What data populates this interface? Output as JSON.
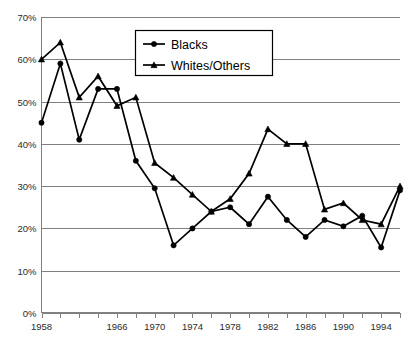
{
  "chart_data": {
    "type": "line",
    "title": "",
    "subtitle": "",
    "xlabel": "",
    "ylabel": "",
    "xlim": [
      1958,
      1996
    ],
    "ylim": [
      0,
      70
    ],
    "y_unit": "%",
    "grid": true,
    "legend_position": "top-center",
    "y_ticks": [
      "0%",
      "10%",
      "20%",
      "30%",
      "40%",
      "50%",
      "60%",
      "70%"
    ],
    "y_tick_values": [
      0,
      10,
      20,
      30,
      40,
      50,
      60,
      70
    ],
    "x_tick_labels": [
      "1958",
      "1966",
      "1970",
      "1974",
      "1978",
      "1982",
      "1986",
      "1990",
      "1994"
    ],
    "x_tick_values": [
      1958,
      1966,
      1970,
      1974,
      1978,
      1982,
      1986,
      1990,
      1994
    ],
    "x": [
      1958,
      1960,
      1962,
      1964,
      1966,
      1968,
      1970,
      1972,
      1974,
      1976,
      1978,
      1980,
      1982,
      1984,
      1986,
      1988,
      1990,
      1992,
      1994,
      1996
    ],
    "series": [
      {
        "name": "Blacks",
        "marker": "circle",
        "color": "#000000",
        "values": [
          45,
          59,
          41,
          53,
          53,
          36,
          29.5,
          16,
          20,
          24,
          25,
          21,
          27.5,
          22,
          18,
          22,
          20.5,
          23,
          15.5,
          29
        ]
      },
      {
        "name": "Whites/Others",
        "marker": "triangle",
        "color": "#000000",
        "values": [
          60,
          64,
          51,
          56,
          49,
          51,
          35.5,
          32,
          28,
          24,
          27,
          33,
          43.5,
          40,
          40,
          24.5,
          26,
          22,
          21,
          30
        ]
      }
    ]
  },
  "legend": {
    "entries": [
      {
        "label": "Blacks"
      },
      {
        "label": "Whites/Others"
      }
    ]
  }
}
